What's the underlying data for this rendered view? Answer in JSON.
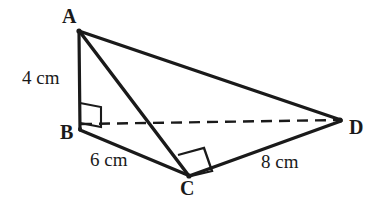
{
  "figure": {
    "background_color": "#ffffff",
    "stroke_color": "#1a1a1a",
    "vertices": [
      {
        "name": "A",
        "label": "A",
        "x": 78,
        "y": 31
      },
      {
        "name": "B",
        "label": "B",
        "x": 80,
        "y": 129
      },
      {
        "name": "C",
        "label": "C",
        "x": 189,
        "y": 176
      },
      {
        "name": "D",
        "label": "D",
        "x": 341,
        "y": 120
      }
    ],
    "edges": [
      {
        "name": "edge-AB",
        "from": "A",
        "to": "B",
        "style": "solid",
        "width": 3
      },
      {
        "name": "edge-AC",
        "from": "A",
        "to": "C",
        "style": "solid",
        "width": 3
      },
      {
        "name": "edge-AD",
        "from": "A",
        "to": "D",
        "style": "solid",
        "width": 3
      },
      {
        "name": "edge-BC",
        "from": "B",
        "to": "C",
        "style": "solid",
        "width": 3
      },
      {
        "name": "edge-CD",
        "from": "C",
        "to": "D",
        "style": "solid",
        "width": 3
      },
      {
        "name": "edge-BD",
        "from": "B",
        "to": "D",
        "style": "dashed",
        "width": 2
      }
    ],
    "measurements": [
      {
        "name": "length-AB",
        "edge": "AB",
        "text": "4 cm"
      },
      {
        "name": "length-BC",
        "edge": "BC",
        "text": "6 cm"
      },
      {
        "name": "length-CD",
        "edge": "CD",
        "text": "8 cm"
      }
    ],
    "right_angles": [
      {
        "name": "right-angle-at-B",
        "vertex": "B",
        "shape": "skewed-square"
      },
      {
        "name": "right-angle-at-C",
        "vertex": "C",
        "shape": "square"
      }
    ]
  }
}
